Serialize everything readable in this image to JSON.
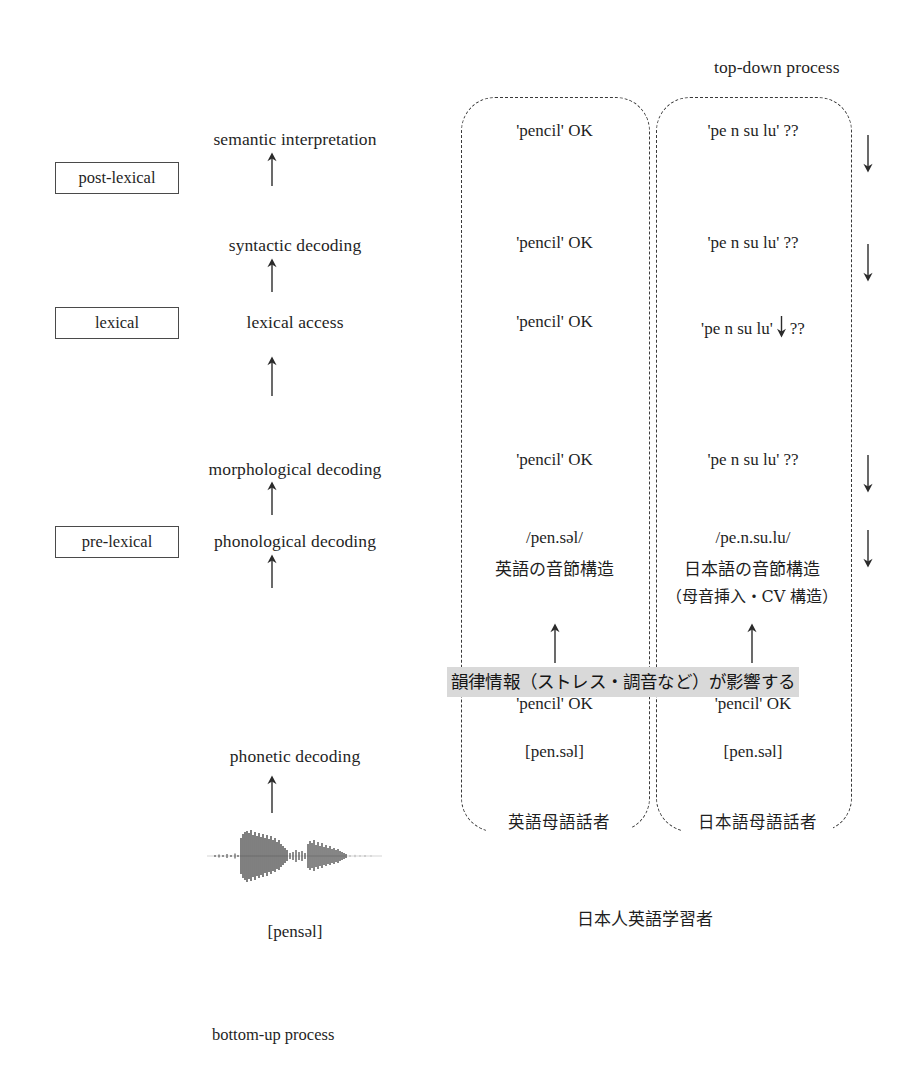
{
  "diagram": {
    "top_label": "top-down process",
    "bottom_label": "bottom-up process",
    "learner_label": "日本人英語学習者",
    "highlight_note": "韻律情報（ストレス・調音など）が影響する",
    "waveform_transcription": "[pensəl]",
    "accent_highlight": "#d9d9d9",
    "line_color": "#3a3a3a"
  },
  "levels": [
    {
      "label": "post-lexical"
    },
    {
      "label": "lexical"
    },
    {
      "label": "pre-lexical"
    }
  ],
  "stages": [
    {
      "label": "semantic interpretation"
    },
    {
      "label": "syntactic decoding"
    },
    {
      "label": "lexical access"
    },
    {
      "label": "morphological decoding"
    },
    {
      "label": "phonological decoding"
    },
    {
      "label": "phonetic decoding"
    }
  ],
  "columns": [
    {
      "name": "english-native-speaker",
      "speaker_label": "英語母語話者",
      "rows": {
        "semantic_interpretation": "'pencil'  OK",
        "syntactic_decoding": "'pencil'  OK",
        "lexical_access": "'pencil'  OK",
        "morphological_decoding": "'pencil'  OK",
        "phonological_decoding_ipa": "/pen.səl/",
        "phonological_decoding_note": "英語の音節構造",
        "phonological_decoding_note2": "",
        "phonetic_decoding_word": "'pencil'  OK",
        "phonetic_decoding_ipa": "[pen.səl]"
      }
    },
    {
      "name": "japanese-native-speaker",
      "speaker_label": "日本語母語話者",
      "rows": {
        "semantic_interpretation": "'pe n su lu'   ??",
        "syntactic_decoding": "'pe n su lu'   ??",
        "lexical_access_prefix": "'pe n su lu'",
        "lexical_access_suffix": "??",
        "morphological_decoding": "'pe n su lu'   ??",
        "phonological_decoding_ipa": "/pe.n.su.lu/",
        "phonological_decoding_note": "日本語の音節構造",
        "phonological_decoding_note2": "（母音挿入・CV 構造）",
        "phonetic_decoding_word": "'pencil'  OK",
        "phonetic_decoding_ipa": "[pen.səl]"
      }
    }
  ]
}
